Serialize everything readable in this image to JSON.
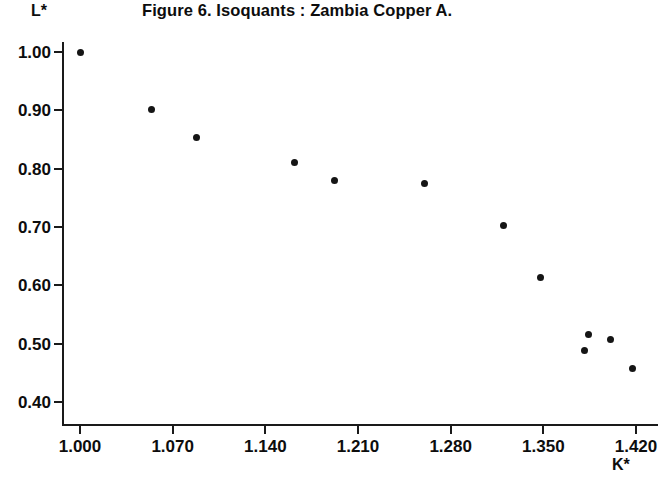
{
  "figure": {
    "title": "Figure 6.  Isoquants : Zambia Copper A.",
    "y_axis_label": "L*",
    "x_axis_label": "K*"
  },
  "chart_data": {
    "type": "scatter",
    "title": "Figure 6.  Isoquants : Zambia Copper A.",
    "xlabel": "K*",
    "ylabel": "L*",
    "xlim": [
      1.0,
      1.42
    ],
    "ylim": [
      0.4,
      1.0
    ],
    "grid": false,
    "legend": null,
    "xticks": [
      1.0,
      1.07,
      1.14,
      1.21,
      1.28,
      1.35,
      1.42
    ],
    "xtick_labels": [
      "1.000",
      "1.070",
      "1.140",
      "1.210",
      "1.280",
      "1.350",
      "1.420"
    ],
    "yticks": [
      0.4,
      0.5,
      0.6,
      0.7,
      0.8,
      0.9,
      1.0
    ],
    "ytick_labels": [
      "0.40",
      "0.50",
      "0.60",
      "0.70",
      "0.80",
      "0.90",
      "1.00"
    ],
    "marker": "circle",
    "marker_color": "#151515",
    "points": [
      {
        "x": 1.0,
        "y": 1.0
      },
      {
        "x": 1.054,
        "y": 0.902
      },
      {
        "x": 1.088,
        "y": 0.853
      },
      {
        "x": 1.162,
        "y": 0.811
      },
      {
        "x": 1.192,
        "y": 0.779
      },
      {
        "x": 1.26,
        "y": 0.775
      },
      {
        "x": 1.32,
        "y": 0.703
      },
      {
        "x": 1.348,
        "y": 0.613
      },
      {
        "x": 1.381,
        "y": 0.488
      },
      {
        "x": 1.384,
        "y": 0.515
      },
      {
        "x": 1.401,
        "y": 0.508
      },
      {
        "x": 1.417,
        "y": 0.457
      }
    ]
  }
}
